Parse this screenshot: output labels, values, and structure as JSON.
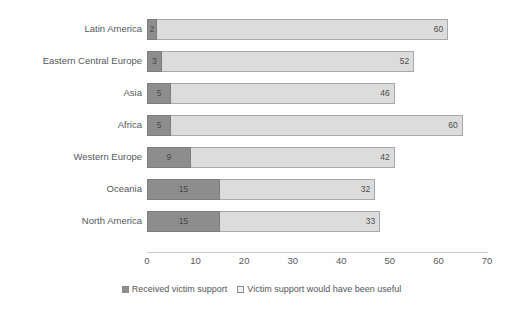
{
  "chart_data": {
    "type": "bar",
    "subtype": "stacked-horizontal",
    "title": "",
    "xlabel": "",
    "ylabel": "",
    "xlim": [
      0,
      70
    ],
    "xticks": [
      0,
      10,
      20,
      30,
      40,
      50,
      60,
      70
    ],
    "grid": false,
    "legend_position": "bottom",
    "categories": [
      "Latin America",
      "Eastern Central Europe",
      "Asia",
      "Africa",
      "Western Europe",
      "Oceania",
      "North America"
    ],
    "series": [
      {
        "name": "Received victim support",
        "color": "#8d8d8d",
        "values": [
          2,
          3,
          5,
          5,
          9,
          15,
          15
        ]
      },
      {
        "name": "Victim support would have been useful",
        "color": "#dcdcdc",
        "values": [
          60,
          52,
          46,
          60,
          42,
          32,
          33
        ]
      }
    ]
  },
  "legend": {
    "items": [
      {
        "label": "Received victim support",
        "swatch": "dark"
      },
      {
        "label": "Victim support would have been useful",
        "swatch": "light"
      }
    ]
  },
  "axis": {
    "ticks": [
      "0",
      "10",
      "20",
      "30",
      "40",
      "50",
      "60",
      "70"
    ]
  },
  "colors": {
    "received": "#8d8d8d",
    "useful": "#dcdcdc",
    "axis": "#c9c9c9",
    "text": "#55595c"
  }
}
